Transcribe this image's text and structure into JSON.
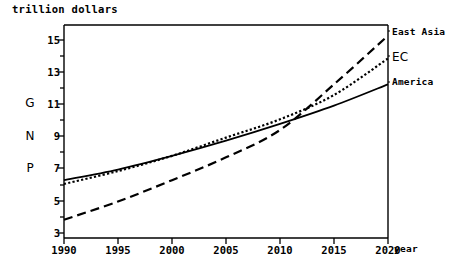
{
  "chart_data": {
    "type": "line",
    "title": "",
    "ylabel": "G N P",
    "yunit_label": "trillion dollars",
    "xlabel": "year",
    "xlim": [
      1990,
      2020
    ],
    "ylim": [
      2.2,
      16.2
    ],
    "xticks": [
      1990,
      1995,
      2000,
      2005,
      2010,
      2015,
      2020
    ],
    "yticks": [
      3,
      5,
      7,
      9,
      11,
      13,
      15
    ],
    "yminor_ticks": [
      4,
      6,
      8,
      10,
      12,
      14,
      16
    ],
    "grid": false,
    "legend_position": "right-outside",
    "x": [
      1990,
      1995,
      2000,
      2005,
      2010,
      2015,
      2020
    ],
    "series": [
      {
        "name": "East Asia",
        "style": "long-dash",
        "values": [
          3.4,
          4.6,
          6.0,
          7.5,
          9.3,
          12.3,
          15.5
        ]
      },
      {
        "name": "EC",
        "style": "dotted",
        "values": [
          5.75,
          6.6,
          7.6,
          8.8,
          10.0,
          11.6,
          14.0
        ]
      },
      {
        "name": "America",
        "style": "solid",
        "values": [
          6.0,
          6.7,
          7.6,
          8.6,
          9.7,
          10.9,
          12.3
        ]
      }
    ]
  },
  "axes": {
    "y_unit_title": "trillion dollars",
    "x_axis_title": "year",
    "gnp_letters": [
      "G",
      "N",
      "P"
    ],
    "y_tick_labels": [
      "15",
      "13",
      "11",
      "9",
      "7",
      "5",
      "3"
    ],
    "x_tick_labels": [
      "1990",
      "1995",
      "2000",
      "2005",
      "2010",
      "2015",
      "2020"
    ]
  },
  "legend": {
    "items": [
      {
        "label": "East Asia"
      },
      {
        "label": "EC"
      },
      {
        "label": "America"
      }
    ]
  },
  "colors": {
    "ink": "#000000",
    "background": "#ffffff"
  }
}
